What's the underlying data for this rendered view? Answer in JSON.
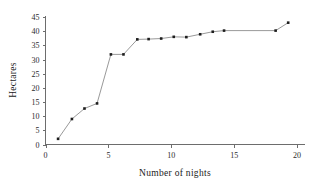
{
  "chart_data": {
    "type": "line",
    "title": "",
    "xlabel": "Number of nights",
    "ylabel": "Hectares",
    "xlim": [
      0,
      20
    ],
    "ylim": [
      0,
      45
    ],
    "xticks": [
      0,
      5,
      10,
      15,
      20
    ],
    "yticks": [
      0,
      5,
      10,
      15,
      20,
      25,
      30,
      35,
      40,
      45
    ],
    "xtick_labels": [
      "0",
      "5",
      "10",
      "15",
      "20"
    ],
    "ytick_labels": [
      "0",
      "5",
      "10",
      "15",
      "20",
      "25",
      "30",
      "35",
      "40",
      "45"
    ],
    "grid": false,
    "legend": null,
    "marker": "square",
    "line_color": "#8d8d8d",
    "marker_color": "#1d1d1d",
    "series": [
      {
        "name": "Hectares",
        "points": [
          {
            "x": 1.0,
            "y": 2.0
          },
          {
            "x": 2.1,
            "y": 9.0
          },
          {
            "x": 3.1,
            "y": 12.7
          },
          {
            "x": 4.1,
            "y": 14.5
          },
          {
            "x": 5.2,
            "y": 31.8
          },
          {
            "x": 6.2,
            "y": 31.8
          },
          {
            "x": 7.3,
            "y": 37.1
          },
          {
            "x": 8.2,
            "y": 37.2
          },
          {
            "x": 9.2,
            "y": 37.4
          },
          {
            "x": 10.2,
            "y": 38.0
          },
          {
            "x": 11.2,
            "y": 37.9
          },
          {
            "x": 12.3,
            "y": 38.9
          },
          {
            "x": 13.3,
            "y": 39.8
          },
          {
            "x": 14.2,
            "y": 40.2
          },
          {
            "x": 18.3,
            "y": 40.2
          },
          {
            "x": 19.3,
            "y": 43.0
          }
        ]
      }
    ]
  },
  "axes": {
    "y_title": "Hectares",
    "x_title": "Number of nights"
  }
}
